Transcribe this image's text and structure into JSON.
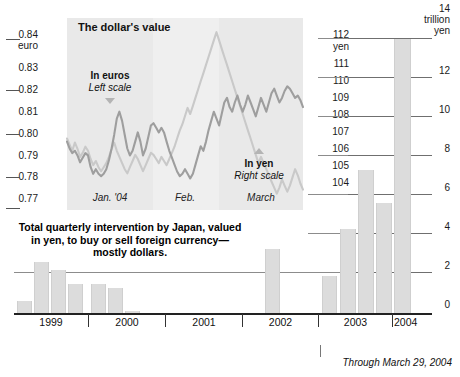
{
  "figure": {
    "top_faint_text": "",
    "source_note": "Through March 29, 2004"
  },
  "line_chart": {
    "title": "The dollar's value",
    "euro_annotation": {
      "line1": "In euros",
      "line2": "Left scale"
    },
    "yen_annotation": {
      "line1": "In yen",
      "line2": "Right scale"
    },
    "left_axis_unit": "euro",
    "right_axis_unit": "yen",
    "left_ticks": [
      "0.84",
      "0.83",
      "0.82",
      "0.81",
      "0.80",
      "0.79",
      "0.78",
      "0.77"
    ],
    "right_ticks": [
      "112",
      "111",
      "110",
      "109",
      "108",
      "107",
      "106",
      "105",
      "104"
    ],
    "month_labels": [
      "Jan. '04",
      "Feb.",
      "March"
    ]
  },
  "bar_chart": {
    "caption_line1": "Total quarterly intervention by Japan, valued",
    "caption_line2": "in yen, to buy or sell foreign currency—",
    "caption_line3": "mostly dollars.",
    "right_axis_unit_line1": "14",
    "right_axis_unit_line2": "trillion",
    "right_axis_unit_line3": "yen",
    "right_ticks": [
      "14",
      "12",
      "10",
      "8",
      "6",
      "4",
      "2",
      "0"
    ],
    "year_labels": [
      "1999",
      "2000",
      "2001",
      "2002",
      "2003",
      "2004"
    ]
  },
  "colors": {
    "euro_line": "#9a9a9a",
    "yen_line": "#c4c4c4",
    "bar_fill": "#dcdcdc",
    "band": "#e9e9e9",
    "grid": "#6f6f6f",
    "axis": "#222222",
    "text": "#111111"
  },
  "chart_data": [
    {
      "type": "line",
      "title": "The dollar's value",
      "xlabel": "",
      "ylabel": "euro",
      "y2label": "yen",
      "ylim": [
        0.765,
        0.845
      ],
      "y2lim": [
        103.5,
        112.5
      ],
      "grid": true,
      "legend_position": "inside-annotations",
      "tick_labels_y": [
        "0.84",
        "0.83",
        "0.82",
        "0.81",
        "0.80",
        "0.79",
        "0.78",
        "0.77"
      ],
      "tick_labels_y2": [
        "112",
        "111",
        "110",
        "109",
        "108",
        "107",
        "106",
        "105",
        "104"
      ],
      "x_tick_labels": [
        "Jan. '04",
        "Feb.",
        "March"
      ],
      "annotations": [
        "The dollar's value",
        "In euros / Left scale",
        "In yen / Right scale"
      ],
      "series": [
        {
          "name": "In euros (left scale)",
          "axis": "left",
          "color": "#9a9a9a",
          "values": [
            0.793,
            0.79,
            0.788,
            0.789,
            0.787,
            0.784,
            0.786,
            0.788,
            0.787,
            0.782,
            0.779,
            0.781,
            0.779,
            0.778,
            0.779,
            0.781,
            0.785,
            0.79,
            0.796,
            0.803,
            0.806,
            0.802,
            0.796,
            0.79,
            0.787,
            0.789,
            0.793,
            0.797,
            0.793,
            0.787,
            0.79,
            0.795,
            0.8,
            0.801,
            0.799,
            0.797,
            0.799,
            0.797,
            0.793,
            0.789,
            0.786,
            0.783,
            0.78,
            0.778,
            0.779,
            0.781,
            0.779,
            0.777,
            0.779,
            0.783,
            0.787,
            0.791,
            0.789,
            0.793,
            0.798,
            0.802,
            0.806,
            0.803,
            0.8,
            0.805,
            0.81,
            0.812,
            0.808,
            0.806,
            0.81,
            0.813,
            0.809,
            0.806,
            0.809,
            0.813,
            0.81,
            0.807,
            0.804,
            0.808,
            0.812,
            0.809,
            0.806,
            0.81,
            0.814,
            0.816,
            0.813,
            0.81,
            0.812,
            0.815,
            0.817,
            0.816,
            0.814,
            0.812,
            0.813,
            0.811,
            0.808
          ]
        },
        {
          "name": "In yen (right scale)",
          "axis": "right",
          "color": "#c4c4c4",
          "values": [
            106.8,
            106.5,
            106.2,
            106.6,
            106.3,
            105.9,
            106.1,
            106.4,
            106.2,
            105.8,
            105.5,
            105.7,
            105.4,
            105.2,
            105.4,
            105.6,
            105.9,
            106.3,
            106.6,
            106.2,
            105.9,
            105.6,
            105.3,
            105.1,
            105.4,
            105.7,
            106.0,
            105.8,
            105.5,
            105.2,
            105.5,
            105.8,
            106.1,
            106.0,
            105.8,
            105.6,
            105.9,
            105.7,
            105.5,
            105.8,
            106.1,
            106.4,
            106.8,
            107.2,
            107.5,
            107.9,
            108.3,
            108.0,
            108.4,
            108.8,
            109.2,
            109.6,
            110.0,
            110.4,
            110.8,
            111.2,
            111.6,
            112.0,
            111.6,
            111.2,
            110.8,
            110.4,
            110.0,
            109.6,
            109.2,
            108.8,
            108.4,
            108.0,
            107.6,
            107.2,
            106.8,
            106.4,
            106.0,
            105.6,
            105.9,
            105.6,
            105.3,
            105.0,
            104.7,
            104.4,
            104.1,
            104.4,
            104.8,
            104.5,
            104.2,
            104.5,
            104.9,
            105.3,
            105.0,
            104.6,
            104.3
          ]
        }
      ]
    },
    {
      "type": "bar",
      "title": "Total quarterly intervention by Japan, valued in yen, to buy or sell foreign currency—mostly dollars.",
      "xlabel": "",
      "ylabel": "trillion yen",
      "ylim": [
        0,
        14
      ],
      "grid": true,
      "y_tick_labels": [
        "0",
        "2",
        "4",
        "6",
        "8",
        "10",
        "12",
        "14"
      ],
      "categories": [
        "1999 Q1",
        "1999 Q2",
        "1999 Q3",
        "1999 Q4",
        "2000 Q1",
        "2000 Q2",
        "2000 Q3",
        "2000 Q4",
        "2001 Q1",
        "2001 Q2",
        "2001 Q3",
        "2001 Q4",
        "2002 Q1",
        "2002 Q2",
        "2002 Q3",
        "2002 Q4",
        "2003 Q1",
        "2003 Q2",
        "2003 Q3",
        "2003 Q4",
        "2004 Q1"
      ],
      "values": [
        0.6,
        2.6,
        2.2,
        1.5,
        1.5,
        1.3,
        0.1,
        0,
        0,
        0,
        0,
        0,
        3.3,
        0,
        0,
        0,
        1.9,
        4.3,
        7.3,
        5.6,
        14.0
      ],
      "group_labels": [
        "1999",
        "2000",
        "2001",
        "2002",
        "2003",
        "2004"
      ],
      "note": "Through March 29, 2004"
    }
  ]
}
